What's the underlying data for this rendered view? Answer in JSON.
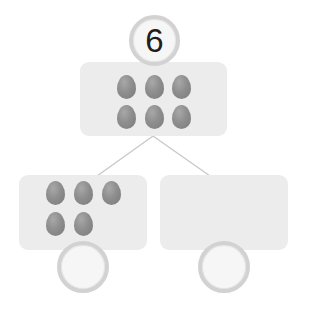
{
  "diagram": {
    "type": "number-bond",
    "whole": {
      "value": "6",
      "egg_count": 6
    },
    "parts": [
      {
        "value": "",
        "egg_count": 5
      },
      {
        "value": "",
        "egg_count": 0
      }
    ]
  },
  "colors": {
    "box": "#ececec",
    "egg": "#8e8e8e",
    "circle_ring": "#d2d2d2",
    "connector": "#c8c8c8",
    "text": "#1e1e1e"
  }
}
